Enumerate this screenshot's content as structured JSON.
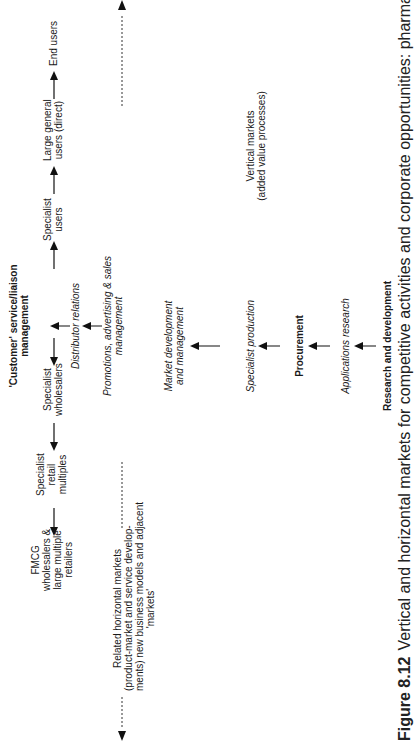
{
  "diagram": {
    "top_row": {
      "fmcg": [
        "FMCG",
        "wholesalers &",
        "large multiple",
        "retailers"
      ],
      "specialist_retail": [
        "Specialist",
        "retail",
        "multiples"
      ],
      "specialist_wholesalers": [
        "Specialist",
        "wholesalers"
      ],
      "customer_service": [
        "'Customer' service/liaison",
        "management"
      ],
      "specialist_users": [
        "Specialist",
        "users"
      ],
      "large_general_users": [
        "Large general",
        "users (direct)"
      ],
      "end_users": "End users"
    },
    "center_column": {
      "distributor_relations": "Distributor relations",
      "promotions": [
        "Promotions, advertising & sales",
        "management"
      ],
      "market_development": [
        "Market development",
        "and management"
      ],
      "specialist_production": "Specialist production",
      "procurement": "Procurement",
      "applications_research": "Applications research",
      "research_development": "Research and development"
    },
    "horizontal_markets": [
      "Related horizontal markets",
      "(product-market and service develop-",
      "ments) new business models and adjacent",
      "'markets'"
    ],
    "vertical_markets": [
      "Vertical markets",
      "(added value processes)"
    ]
  },
  "caption": {
    "number": "Figure 8.12",
    "text": "Vertical and horizontal markets for competitive activities and corporate opportunities: pharmaceuticals"
  }
}
